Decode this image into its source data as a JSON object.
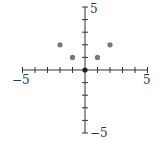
{
  "chart_data": {
    "type": "scatter",
    "title": "",
    "xlabel": "",
    "ylabel": "",
    "xlim": [
      -5,
      5
    ],
    "ylim": [
      -5,
      5
    ],
    "grid": false,
    "axes_style": "centered",
    "tick_step": 1,
    "tick_labels": {
      "x_min": "−5",
      "x_max": "5",
      "y_min": "−5",
      "y_max": "5"
    },
    "points": [
      {
        "x": -2,
        "y": 2
      },
      {
        "x": -1,
        "y": 1
      },
      {
        "x": 0,
        "y": 0
      },
      {
        "x": 1,
        "y": 1
      },
      {
        "x": 2,
        "y": 2
      }
    ],
    "point_color": "#777777",
    "origin_point_color": "#222222",
    "axis_color": "#333333"
  }
}
